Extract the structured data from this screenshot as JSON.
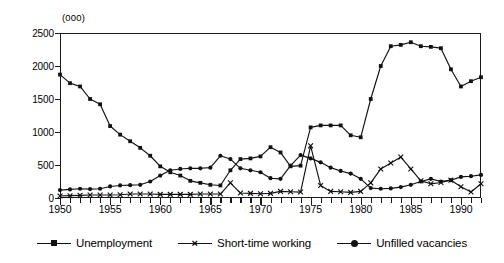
{
  "chart_data": {
    "type": "line",
    "title": "",
    "subtitle": "",
    "units_label": "(000)",
    "xlabel": "",
    "ylabel": "",
    "xlim": [
      1950,
      1992
    ],
    "ylim": [
      0,
      2500
    ],
    "grid": false,
    "legend_position": "bottom",
    "y_ticks": [
      0,
      500,
      1000,
      1500,
      2000,
      2500
    ],
    "y_tick_labels": [
      "0",
      "500",
      "1000",
      "1500",
      "2000",
      "2500"
    ],
    "x_ticks_major": [
      1950,
      1955,
      1960,
      1965,
      1970,
      1975,
      1980,
      1985,
      1990
    ],
    "x_tick_labels": [
      "1950",
      "1955",
      "1960",
      "1965",
      "1970",
      "1975",
      "1980",
      "1985",
      "1990"
    ],
    "x": [
      1950,
      1951,
      1952,
      1953,
      1954,
      1955,
      1956,
      1957,
      1958,
      1959,
      1960,
      1961,
      1962,
      1963,
      1964,
      1965,
      1966,
      1967,
      1968,
      1969,
      1970,
      1971,
      1972,
      1973,
      1974,
      1975,
      1976,
      1977,
      1978,
      1979,
      1980,
      1981,
      1982,
      1983,
      1984,
      1985,
      1986,
      1987,
      1988,
      1989,
      1990,
      1991,
      1992
    ],
    "series": [
      {
        "name": "Unemployment",
        "marker": "square",
        "values": [
          1870,
          1740,
          1690,
          1500,
          1420,
          1090,
          960,
          860,
          760,
          640,
          480,
          390,
          340,
          260,
          230,
          200,
          190,
          420,
          590,
          600,
          630,
          770,
          690,
          480,
          490,
          1070,
          1100,
          1100,
          1100,
          950,
          920,
          1500,
          2000,
          2300,
          2320,
          2360,
          2300,
          2290,
          2270,
          1950,
          1690,
          1770,
          1830
        ]
      },
      {
        "name": "Short-time working",
        "marker": "cross",
        "values": [
          30,
          35,
          40,
          45,
          45,
          45,
          50,
          60,
          60,
          60,
          55,
          55,
          55,
          55,
          60,
          60,
          60,
          230,
          75,
          70,
          65,
          70,
          100,
          95,
          90,
          790,
          190,
          100,
          95,
          85,
          100,
          230,
          440,
          530,
          620,
          440,
          260,
          215,
          235,
          270,
          170,
          90,
          215
        ]
      },
      {
        "name": "Unfilled vacancies",
        "marker": "circle",
        "values": [
          120,
          130,
          140,
          135,
          140,
          175,
          190,
          195,
          200,
          250,
          340,
          420,
          440,
          450,
          450,
          460,
          640,
          590,
          450,
          420,
          390,
          300,
          290,
          490,
          650,
          600,
          540,
          460,
          410,
          370,
          290,
          150,
          140,
          145,
          165,
          200,
          250,
          290,
          250,
          270,
          320,
          330,
          350
        ]
      }
    ],
    "legend": [
      {
        "label": "Unemployment",
        "marker": "square"
      },
      {
        "label": "Short-time working",
        "marker": "cross"
      },
      {
        "label": "Unfilled vacancies",
        "marker": "circle"
      }
    ]
  }
}
